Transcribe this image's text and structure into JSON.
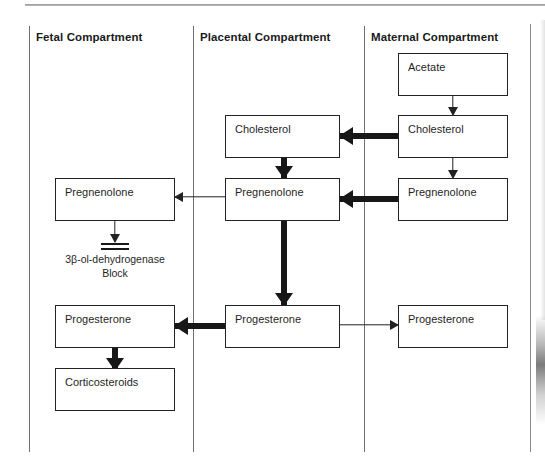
{
  "figure": {
    "columns": [
      {
        "id": "fetal",
        "label": "Fetal Compartment"
      },
      {
        "id": "placental",
        "label": "Placental Compartment"
      },
      {
        "id": "maternal",
        "label": "Maternal Compartment"
      }
    ],
    "nodes": [
      {
        "id": "maternal-acetate",
        "column": "maternal",
        "label": "Acetate"
      },
      {
        "id": "maternal-cholesterol",
        "column": "maternal",
        "label": "Cholesterol"
      },
      {
        "id": "maternal-pregnenolone",
        "column": "maternal",
        "label": "Pregnenolone"
      },
      {
        "id": "maternal-progesterone",
        "column": "maternal",
        "label": "Progesterone"
      },
      {
        "id": "placental-cholesterol",
        "column": "placental",
        "label": "Cholesterol"
      },
      {
        "id": "placental-pregnenolone",
        "column": "placental",
        "label": "Pregnenolone"
      },
      {
        "id": "placental-progesterone",
        "column": "placental",
        "label": "Progesterone"
      },
      {
        "id": "fetal-pregnenolone",
        "column": "fetal",
        "label": "Pregnenolone"
      },
      {
        "id": "fetal-progesterone",
        "column": "fetal",
        "label": "Progesterone"
      },
      {
        "id": "fetal-corticosteroids",
        "column": "fetal",
        "label": "Corticosteroids"
      }
    ],
    "enzyme_block": {
      "line1": "3β-ol-dehydrogenase",
      "line2": "Block"
    },
    "edges": [
      {
        "id": "acetate-to-cholesterol",
        "from": "maternal-acetate",
        "to": "maternal-cholesterol",
        "weight": "thin",
        "direction": "down"
      },
      {
        "id": "cholesterol-to-pregnenolone",
        "from": "maternal-cholesterol",
        "to": "maternal-pregnenolone",
        "weight": "thin",
        "direction": "down"
      },
      {
        "id": "maternal-to-placental-chol",
        "from": "maternal-cholesterol",
        "to": "placental-cholesterol",
        "weight": "thick",
        "direction": "left"
      },
      {
        "id": "maternal-to-placental-preg",
        "from": "maternal-pregnenolone",
        "to": "placental-pregnenolone",
        "weight": "thick",
        "direction": "left"
      },
      {
        "id": "placental-chol-to-preg",
        "from": "placental-cholesterol",
        "to": "placental-pregnenolone",
        "weight": "thick",
        "direction": "down"
      },
      {
        "id": "placental-preg-to-fetal",
        "from": "placental-pregnenolone",
        "to": "fetal-pregnenolone",
        "weight": "thin",
        "direction": "left"
      },
      {
        "id": "placental-preg-to-prog",
        "from": "placental-pregnenolone",
        "to": "placental-progesterone",
        "weight": "thick",
        "direction": "down"
      },
      {
        "id": "placental-prog-to-fetal",
        "from": "placental-progesterone",
        "to": "fetal-progesterone",
        "weight": "thick",
        "direction": "left"
      },
      {
        "id": "placental-prog-to-maternal",
        "from": "placental-progesterone",
        "to": "maternal-progesterone",
        "weight": "thin",
        "direction": "right"
      },
      {
        "id": "fetal-preg-to-block",
        "from": "fetal-pregnenolone",
        "to": "enzyme-block",
        "weight": "thin",
        "direction": "down"
      },
      {
        "id": "fetal-prog-to-cortico",
        "from": "fetal-progesterone",
        "to": "fetal-corticosteroids",
        "weight": "thick",
        "direction": "down"
      }
    ],
    "colors": {
      "ink": "#1a1a1a",
      "box_border": "#222222",
      "arrow": "#171717",
      "divider": "#6f6f6f",
      "background": "#ffffff"
    }
  }
}
